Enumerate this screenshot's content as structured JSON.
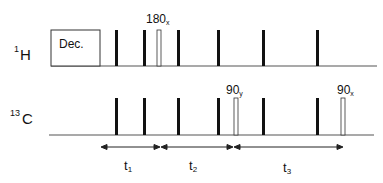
{
  "channels": {
    "h1": {
      "iso_mass": "1",
      "nucleus": "H",
      "decoupling_label": "Dec.",
      "pulse_label_main": "180",
      "pulse_label_sub": "x"
    },
    "c13": {
      "iso_mass": "13",
      "nucleus": "C",
      "pulse_a_main": "90",
      "pulse_a_sub": "y",
      "pulse_b_main": "90",
      "pulse_b_sub": "x"
    }
  },
  "delays": [
    {
      "main": "t",
      "sub": "1"
    },
    {
      "main": "t",
      "sub": "2"
    },
    {
      "main": "t",
      "sub": "3"
    }
  ],
  "colors": {
    "line": "#555555",
    "pulse": "#111111"
  }
}
